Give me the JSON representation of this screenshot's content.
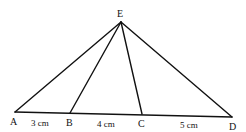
{
  "diagram": {
    "type": "geometry-triangle",
    "points": {
      "A": {
        "label": "A",
        "x": 15,
        "y": 112
      },
      "B": {
        "label": "B",
        "x": 70,
        "y": 113
      },
      "C": {
        "label": "C",
        "x": 142,
        "y": 114
      },
      "D": {
        "label": "D",
        "x": 232,
        "y": 117
      },
      "E": {
        "label": "E",
        "x": 121,
        "y": 22
      }
    },
    "segments": [
      {
        "from": "A",
        "to": "D"
      },
      {
        "from": "E",
        "to": "A"
      },
      {
        "from": "E",
        "to": "B"
      },
      {
        "from": "E",
        "to": "C"
      },
      {
        "from": "E",
        "to": "D"
      }
    ],
    "measurements": [
      {
        "segment": "AB",
        "label": "3 cm"
      },
      {
        "segment": "BC",
        "label": "4 cm"
      },
      {
        "segment": "CD",
        "label": "5 cm"
      }
    ],
    "stroke_color": "#111111"
  }
}
